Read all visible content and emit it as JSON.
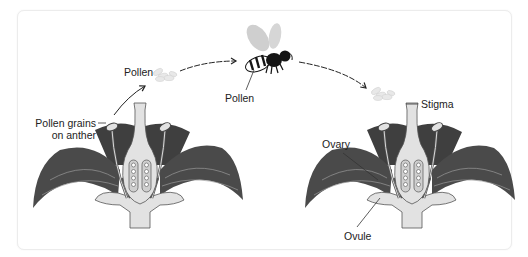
{
  "diagram": {
    "title": "",
    "type": "pollination-process",
    "labels": {
      "pollen_top_left": "Pollen",
      "pollen_on_bee": "Pollen",
      "pollen_grains_line1": "Pollen grains",
      "pollen_grains_line2": "on anther",
      "stigma": "Stigma",
      "ovary": "Ovary",
      "ovule": "Ovule"
    },
    "nodes": [
      {
        "id": "flower-left",
        "role": "source flower",
        "labels": [
          "Pollen grains on anther"
        ]
      },
      {
        "id": "pollen-cloud-left",
        "role": "released pollen",
        "labels": [
          "Pollen"
        ]
      },
      {
        "id": "bee",
        "role": "pollinator",
        "labels": [
          "Pollen"
        ]
      },
      {
        "id": "pollen-cloud-right",
        "role": "pollen deposited",
        "labels": []
      },
      {
        "id": "flower-right",
        "role": "recipient flower",
        "labels": [
          "Stigma",
          "Ovary",
          "Ovule"
        ]
      }
    ],
    "edges": [
      {
        "from": "flower-left",
        "to": "pollen-cloud-left",
        "style": "solid-arrow"
      },
      {
        "from": "pollen-cloud-left",
        "to": "bee",
        "style": "dashed-arrow"
      },
      {
        "from": "bee",
        "to": "pollen-cloud-right",
        "style": "dashed-arrow"
      }
    ],
    "colors": {
      "petal": "#4a4a4a",
      "petal_vein": "#9a9a9a",
      "pistil": "#e2e2e2",
      "outline": "#555555",
      "pollen": "#e6e6e6",
      "wing": "#cfcfcf",
      "bee_body": "#151515",
      "text": "#222222"
    }
  }
}
